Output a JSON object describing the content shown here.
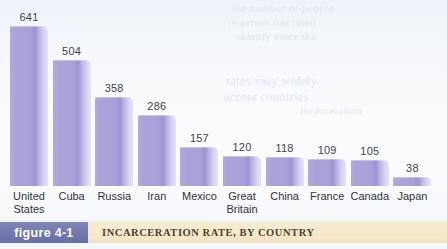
{
  "chart_data": {
    "type": "bar",
    "title": "INCARCERATION RATE, BY COUNTRY",
    "figure_number": "figure 4-1",
    "xlabel": "",
    "ylabel": "",
    "ylim": [
      0,
      700
    ],
    "grid": false,
    "legend": null,
    "categories": [
      "United\nStates",
      "Cuba",
      "Russia",
      "Iran",
      "Mexico",
      "Great\nBritain",
      "China",
      "France",
      "Canada",
      "Japan"
    ],
    "values": [
      641,
      504,
      358,
      286,
      157,
      120,
      118,
      109,
      105,
      38
    ],
    "value_labels": [
      "641",
      "504",
      "358",
      "286",
      "157",
      "120",
      "118",
      "109",
      "105",
      "38"
    ]
  },
  "caption": {
    "figure_tag": "figure 4-1",
    "title": "INCARCERATION RATE, BY COUNTRY"
  },
  "colors": {
    "bar_face": "#a9a1d8",
    "bar_highlight": "#e7e4f6",
    "background": "#f4f7fb",
    "figure_tag_bg": "#6f77ad",
    "caption_band_bg": "#f6e9cb",
    "value_text": "#3f4450",
    "label_text": "#2f3440"
  },
  "bleed_through": {
    "line1": "the number of people",
    "line2": "in prison has risen",
    "line3": "sharply since the",
    "line4": "rates vary widely",
    "line5": "across countries",
    "line6": "incarceration"
  }
}
